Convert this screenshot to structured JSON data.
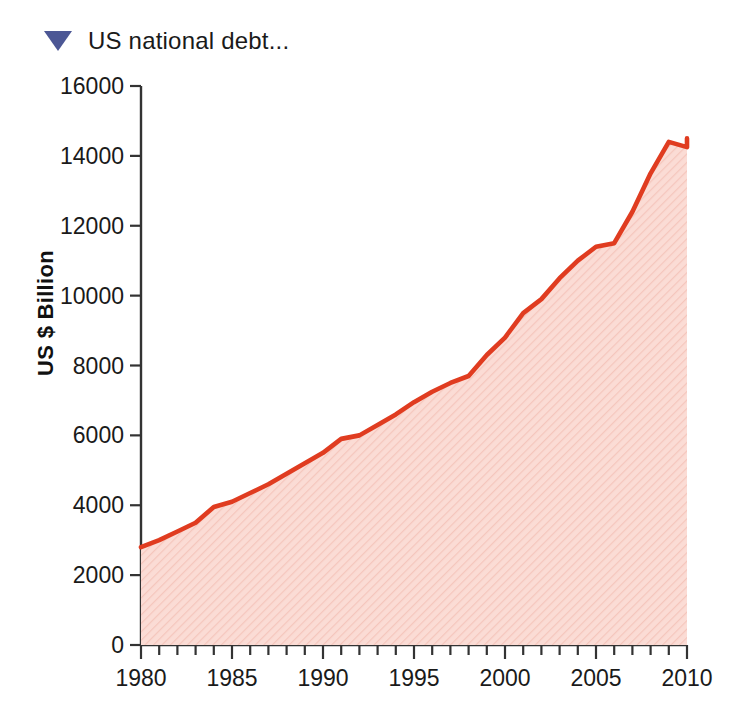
{
  "header": {
    "title": "US national debt...",
    "triangle_icon": "triangle-down-icon",
    "triangle_color": "#4c5795"
  },
  "chart_data": {
    "type": "area",
    "title": "US national debt...",
    "xlabel": "",
    "ylabel": "US $ Billion",
    "xlim": [
      1980,
      2010
    ],
    "ylim": [
      0,
      16000
    ],
    "grid": false,
    "legend": null,
    "line_color": "#e03c20",
    "fill_color": "#f8d3cb",
    "fill_pattern": "diagonal-hatch",
    "axis_color": "#333333",
    "background": "#ffffff",
    "xticks": [
      1980,
      1985,
      1990,
      1995,
      2000,
      2005,
      2010
    ],
    "xtick_labels": [
      "1980",
      "1985",
      "1990",
      "1995",
      "2000",
      "2005",
      "2010"
    ],
    "xminor_tick_step": 1,
    "yticks": [
      0,
      2000,
      4000,
      6000,
      8000,
      10000,
      12000,
      14000,
      16000
    ],
    "ytick_labels": [
      "0",
      "2000",
      "4000",
      "6000",
      "8000",
      "10000",
      "12000",
      "14000",
      "16000"
    ],
    "x": [
      1980,
      1981,
      1982,
      1983,
      1984,
      1985,
      1986,
      1987,
      1988,
      1989,
      1990,
      1991,
      1992,
      1993,
      1994,
      1995,
      1996,
      1997,
      1998,
      1999,
      2000,
      2001,
      2002,
      2003,
      2004,
      2005,
      2006,
      2007,
      2008,
      2009,
      2010
    ],
    "values": [
      2800,
      3000,
      3250,
      3500,
      3950,
      4100,
      4350,
      4600,
      4900,
      5200,
      5500,
      5900,
      6000,
      6300,
      6600,
      6950,
      7250,
      7500,
      7700,
      8300,
      8800,
      9500,
      9900,
      10500,
      11000,
      11400,
      11500,
      12400,
      13500,
      14400,
      14250
    ],
    "annotations": [
      {
        "x": 1980,
        "y": 2800,
        "note": "series start"
      },
      {
        "x": 2008,
        "y": 14400,
        "note": "peak before dip"
      },
      {
        "x": 2009,
        "y": 14250,
        "note": "dip"
      },
      {
        "x": 2010,
        "y": 14500,
        "note": "series end"
      }
    ],
    "series_end_value": 14500
  },
  "plot_geometry": {
    "left_px": 141,
    "right_px": 687,
    "top_px": 86,
    "bottom_px": 645
  }
}
